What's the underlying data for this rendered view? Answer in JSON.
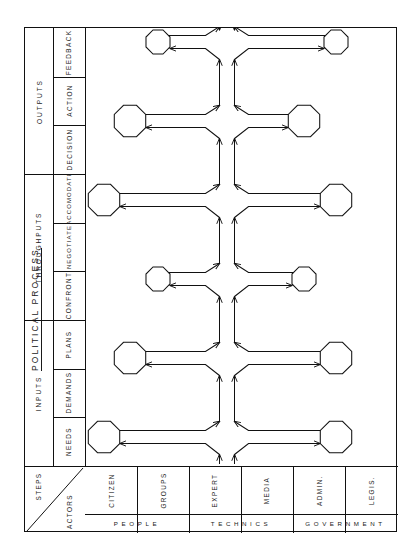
{
  "title": "POLITICAL PROCESS",
  "corner": {
    "upper_label": "STEPS",
    "lower_label": "ACTORS"
  },
  "phases": [
    {
      "name": "OUTPUTS",
      "steps": [
        "FEEDBACK",
        "ACTION",
        "DECISION"
      ]
    },
    {
      "name": "THROUGHPUTS",
      "steps": [
        "ACCOMODATE",
        "NEGOTIATE",
        "CONFRONT"
      ]
    },
    {
      "name": "INPUTS",
      "steps": [
        "PLANS",
        "DEMANDS",
        "NEEDS"
      ]
    }
  ],
  "actor_groups": [
    {
      "name": "PEOPLE",
      "actors": [
        "CITIZEN",
        "GROUPS"
      ]
    },
    {
      "name": "TECHNICS",
      "actors": [
        "EXPERT",
        "MEDIA"
      ]
    },
    {
      "name": "GOVERNMENT",
      "actors": [
        "ADMIN.",
        "LEGIS."
      ]
    }
  ],
  "diagram": {
    "kind": "flow-network",
    "node_shape": "octagon",
    "levels": 6,
    "nodes_per_level": 2,
    "stroke_color": "#111111",
    "background_color": "#ffffff"
  },
  "chart_data": {
    "type": "table",
    "title": "POLITICAL PROCESS",
    "row_header": "STEPS",
    "col_header": "ACTORS",
    "columns": [
      "CITIZEN",
      "GROUPS",
      "EXPERT",
      "MEDIA",
      "ADMIN.",
      "LEGIS."
    ],
    "column_groups": [
      "PEOPLE",
      "PEOPLE",
      "TECHNICS",
      "TECHNICS",
      "GOVERNMENT",
      "GOVERNMENT"
    ],
    "rows": [
      "FEEDBACK",
      "ACTION",
      "DECISION",
      "ACCOMODATE",
      "NEGOTIATE",
      "CONFRONT",
      "PLANS",
      "DEMANDS",
      "NEEDS"
    ],
    "row_groups": [
      "OUTPUTS",
      "OUTPUTS",
      "OUTPUTS",
      "THROUGHPUTS",
      "THROUGHPUTS",
      "THROUGHPUTS",
      "INPUTS",
      "INPUTS",
      "INPUTS"
    ]
  }
}
